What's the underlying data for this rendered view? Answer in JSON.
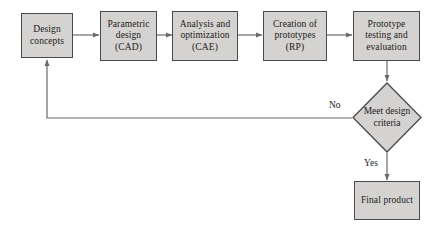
{
  "diagram": {
    "style": {
      "node_fill": "#d5d3d1",
      "node_stroke": "#4a4a4a",
      "line_color": "#6b6b6b",
      "text_color": "#1a1a1a",
      "background": "#ffffff"
    },
    "nodes": [
      {
        "id": "design-concepts",
        "shape": "rect",
        "lines": [
          "Design",
          "concepts"
        ]
      },
      {
        "id": "parametric-design",
        "shape": "rect",
        "lines": [
          "Parametric",
          "design",
          "(CAD)"
        ]
      },
      {
        "id": "analysis-optimization",
        "shape": "rect",
        "lines": [
          "Analysis and",
          "optimization",
          "(CAE)"
        ]
      },
      {
        "id": "creation-prototypes",
        "shape": "rect",
        "lines": [
          "Creation of",
          "prototypes",
          "(RP)"
        ]
      },
      {
        "id": "prototype-testing",
        "shape": "rect",
        "lines": [
          "Prototype",
          "testing and",
          "evaluation"
        ]
      },
      {
        "id": "meet-design-criteria",
        "shape": "diamond",
        "lines": [
          "Meet",
          "design",
          "criteria"
        ]
      },
      {
        "id": "final-product",
        "shape": "rect",
        "lines": [
          "Final product"
        ]
      }
    ],
    "edge_labels": {
      "no": "No",
      "yes": "Yes"
    }
  }
}
